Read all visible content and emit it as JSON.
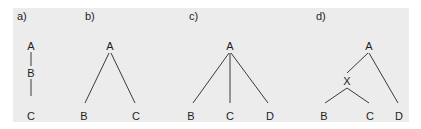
{
  "figure": {
    "background_color": "#ececec",
    "line_color": "#3a3a3a",
    "text_color": "#1e1e1e",
    "panels": [
      {
        "id": "a",
        "label": "a)",
        "nodes": [
          {
            "id": "A",
            "label": "A"
          },
          {
            "id": "B",
            "label": "B"
          },
          {
            "id": "C",
            "label": "C"
          }
        ],
        "edges": [
          [
            "A",
            "B"
          ],
          [
            "B",
            "C"
          ]
        ],
        "description": "Linear chain A – B – C"
      },
      {
        "id": "b",
        "label": "b)",
        "nodes": [
          {
            "id": "A",
            "label": "A"
          },
          {
            "id": "B",
            "label": "B"
          },
          {
            "id": "C",
            "label": "C"
          }
        ],
        "edges": [
          [
            "A",
            "B"
          ],
          [
            "A",
            "C"
          ]
        ],
        "description": "A branches to B and C"
      },
      {
        "id": "c",
        "label": "c)",
        "nodes": [
          {
            "id": "A",
            "label": "A"
          },
          {
            "id": "B",
            "label": "B"
          },
          {
            "id": "C",
            "label": "C"
          },
          {
            "id": "D",
            "label": "D"
          }
        ],
        "edges": [
          [
            "A",
            "B"
          ],
          [
            "A",
            "C"
          ],
          [
            "A",
            "D"
          ]
        ],
        "description": "A branches to B, C and D"
      },
      {
        "id": "d",
        "label": "d)",
        "nodes": [
          {
            "id": "A",
            "label": "A"
          },
          {
            "id": "X",
            "label": "X"
          },
          {
            "id": "B",
            "label": "B"
          },
          {
            "id": "C",
            "label": "C"
          },
          {
            "id": "D",
            "label": "D"
          }
        ],
        "edges": [
          [
            "A",
            "X"
          ],
          [
            "A",
            "D"
          ],
          [
            "X",
            "B"
          ],
          [
            "X",
            "C"
          ]
        ],
        "description": "A branches to X and D; X branches to B and C"
      }
    ]
  }
}
